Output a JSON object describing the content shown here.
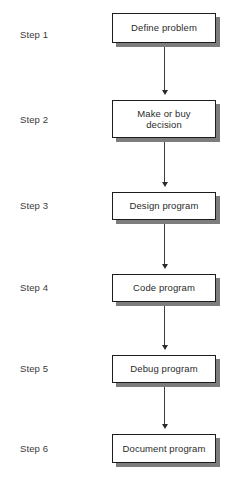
{
  "diagram": {
    "type": "flowchart",
    "orientation": "vertical",
    "title": "",
    "colors": {
      "background": "#ffffff",
      "box_fill": "#ffffff",
      "box_border": "#1c1c1c",
      "box_shadow": "#7d7d7d",
      "text": "#2b2b2b",
      "connector": "#3c3c3c"
    },
    "nodes": [
      {
        "step_label": "Step 1",
        "text": "Define problem",
        "x": 112,
        "y": 13,
        "width": 104,
        "height": 30
      },
      {
        "step_label": "Step 2",
        "text": "Make or buy\ndecision",
        "x": 112,
        "y": 100,
        "width": 104,
        "height": 38
      },
      {
        "step_label": "Step 3",
        "text": "Design program",
        "x": 112,
        "y": 192,
        "width": 104,
        "height": 28
      },
      {
        "step_label": "Step 4",
        "text": "Code program",
        "x": 112,
        "y": 274,
        "width": 104,
        "height": 28
      },
      {
        "step_label": "Step 5",
        "text": "Debug program",
        "x": 112,
        "y": 355,
        "width": 104,
        "height": 28
      },
      {
        "step_label": "Step 6",
        "text": "Document program",
        "x": 112,
        "y": 434,
        "width": 104,
        "height": 29
      }
    ],
    "connectors": [
      {
        "from": "Define problem",
        "to": "Make or buy decision",
        "x": 164,
        "y": 47,
        "length": 48
      },
      {
        "from": "Make or buy decision",
        "to": "Design program",
        "x": 164,
        "y": 142,
        "length": 45
      },
      {
        "from": "Design program",
        "to": "Code program",
        "x": 164,
        "y": 224,
        "length": 45
      },
      {
        "from": "Code program",
        "to": "Debug program",
        "x": 164,
        "y": 306,
        "length": 44
      },
      {
        "from": "Debug program",
        "to": "Document program",
        "x": 164,
        "y": 387,
        "length": 42
      }
    ]
  }
}
